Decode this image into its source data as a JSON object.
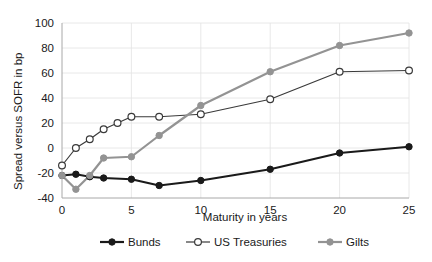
{
  "chart_data": {
    "type": "line",
    "title": "",
    "xlabel": "Maturity in years",
    "ylabel": "Spread versus SOFR in bp",
    "xlim": [
      0,
      25
    ],
    "ylim": [
      -40,
      100
    ],
    "xticks": [
      0,
      5,
      10,
      15,
      20,
      25
    ],
    "yticks": [
      -40,
      -20,
      0,
      20,
      40,
      60,
      80,
      100
    ],
    "xtick_labels": [
      "0",
      "5",
      "10",
      "15",
      "20",
      "25"
    ],
    "ytick_labels": [
      "-40",
      "-20",
      "0",
      "20",
      "40",
      "60",
      "80",
      "100"
    ],
    "grid": true,
    "legend_position": "bottom",
    "series": [
      {
        "name": "Bunds",
        "color": "#1a1a1a",
        "marker": "filled-circle",
        "marker_fill": "#1a1a1a",
        "x": [
          0,
          1,
          2,
          3,
          5,
          7,
          10,
          15,
          20,
          25
        ],
        "values": [
          -22,
          -21,
          -23,
          -24,
          -25,
          -30,
          -26,
          -17,
          -4,
          1
        ]
      },
      {
        "name": "US Treasuries",
        "color": "#3a3a3a",
        "marker": "open-circle",
        "marker_fill": "#ffffff",
        "x": [
          0,
          1,
          2,
          3,
          4,
          5,
          7,
          10,
          15,
          20,
          25
        ],
        "values": [
          -14,
          0,
          7,
          15,
          20,
          25,
          25,
          27,
          39,
          61,
          62
        ]
      },
      {
        "name": "Gilts",
        "color": "#939393",
        "marker": "filled-circle",
        "marker_fill": "#939393",
        "x": [
          0,
          1,
          2,
          3,
          5,
          7,
          10,
          15,
          20,
          25
        ],
        "values": [
          -22,
          -33,
          -22,
          -8,
          -7,
          10,
          34,
          61,
          82,
          92
        ]
      }
    ]
  },
  "axes": {
    "ylabel": "Spread versus SOFR in bp",
    "xlabel": "Maturity in years"
  },
  "legend": {
    "items": [
      {
        "label": "Bunds"
      },
      {
        "label": "US Treasuries"
      },
      {
        "label": "Gilts"
      }
    ]
  }
}
